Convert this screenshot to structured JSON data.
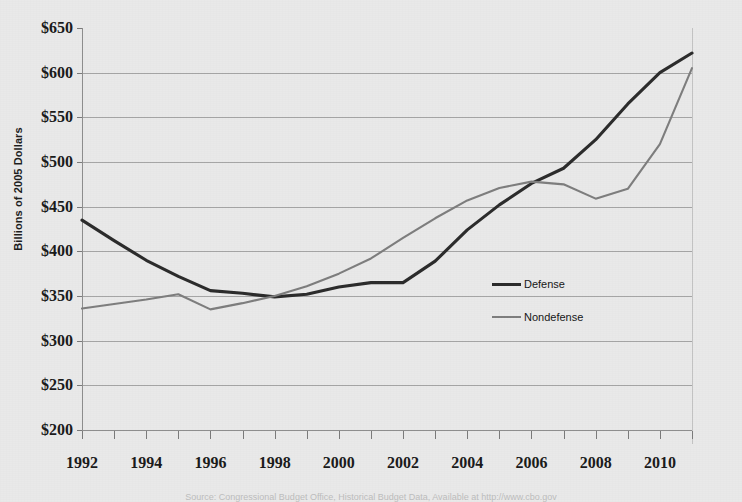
{
  "figure": {
    "background_color": "#e9e9e9",
    "plot_border_color": "#b9b9b9",
    "gridline_color": "#8d8d8d",
    "source_note": "Source: Congressional Budget Office, Historical Budget Data, Available at http://www.cbo.gov"
  },
  "chart_data": {
    "type": "line",
    "title": "",
    "subtitle": "",
    "xlabel": "",
    "ylabel": "Billions of 2005 Dollars",
    "xlim": [
      1992,
      2011
    ],
    "ylim": [
      200,
      650
    ],
    "ytick_step": 50,
    "ytick_labels": [
      "$650",
      "$600",
      "$550",
      "$500",
      "$450",
      "$400",
      "$350",
      "$300",
      "$250",
      "$200"
    ],
    "ytick_values": [
      650,
      600,
      550,
      500,
      450,
      400,
      350,
      300,
      250,
      200
    ],
    "xtick_labels": [
      "1992",
      "1994",
      "1996",
      "1998",
      "2000",
      "2002",
      "2004",
      "2006",
      "2008",
      "2010"
    ],
    "xtick_values": [
      1992,
      1994,
      1996,
      1998,
      2000,
      2002,
      2004,
      2006,
      2008,
      2010
    ],
    "x": [
      1992,
      1993,
      1994,
      1995,
      1996,
      1997,
      1998,
      1999,
      2000,
      2001,
      2002,
      2003,
      2004,
      2005,
      2006,
      2007,
      2008,
      2009,
      2010,
      2011
    ],
    "grid": "horizontal",
    "legend_position": "center-right",
    "series": [
      {
        "name": "Defense",
        "color": "#2b2b2b",
        "line_width": 3.1,
        "values": [
          435,
          412,
          390,
          372,
          356,
          353,
          349,
          352,
          360,
          365,
          365,
          389,
          424,
          452,
          476,
          493,
          525,
          565,
          600,
          622
        ]
      },
      {
        "name": "Nondefense",
        "color": "#7d7d7d",
        "line_width": 2.1,
        "values": [
          336,
          341,
          346,
          352,
          335,
          342,
          350,
          361,
          375,
          392,
          415,
          437,
          457,
          471,
          478,
          475,
          459,
          470,
          520,
          605
        ]
      }
    ]
  },
  "legend": {
    "items": [
      {
        "label": "Defense",
        "color": "#2b2b2b",
        "line_width": 3.1
      },
      {
        "label": "Nondefense",
        "color": "#7d7d7d",
        "line_width": 2.1
      }
    ]
  }
}
